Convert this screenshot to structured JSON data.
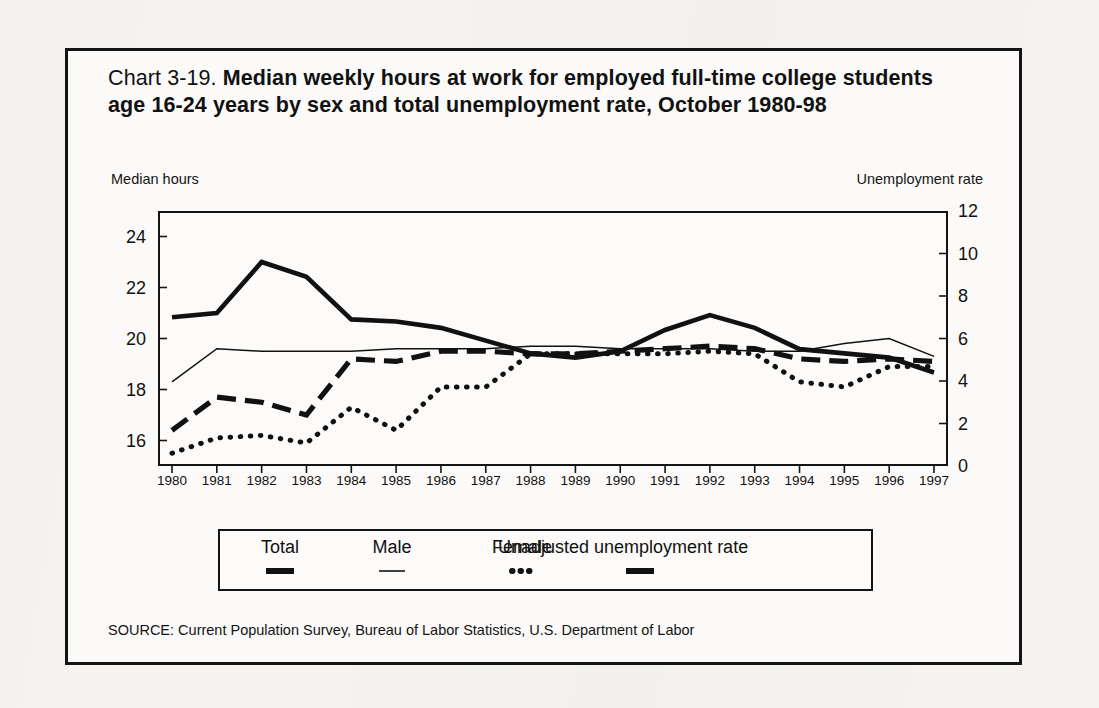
{
  "figure": {
    "title_prefix": "Chart 3-19. ",
    "title_main": "Median weekly hours at work for employed full-time college students age 16-24 years by sex and total unemployment rate, October 1980-98",
    "source": "SOURCE: Current Population Survey, Bureau of Labor Statistics, U.S. Department of Labor",
    "frame_color": "#141414"
  },
  "legend": {
    "entries": [
      {
        "label": "Total",
        "style": "thick-dash",
        "name": "legend-total"
      },
      {
        "label": "Male",
        "style": "thin-solid",
        "name": "legend-male"
      },
      {
        "label": "Female",
        "style": "dotted",
        "name": "legend-female"
      },
      {
        "label": "Unadjusted unemployment rate",
        "style": "thick-solid",
        "name": "legend-unemployment"
      }
    ]
  },
  "chart_data": {
    "type": "line",
    "title": "Chart 3-19. Median weekly hours at work for employed full-time college students age 16-24 years by sex and total unemployment rate, October 1980-98",
    "xlabel": "",
    "ylabel": "Median hours",
    "y2label": "Unemployment rate",
    "left_axis_caption": "Median hours",
    "right_axis_caption": "Unemployment rate",
    "grid": false,
    "legend_position": "below",
    "x": [
      1980,
      1981,
      1982,
      1983,
      1984,
      1985,
      1986,
      1987,
      1988,
      1989,
      1990,
      1991,
      1992,
      1993,
      1994,
      1995,
      1996,
      1997
    ],
    "categories": [
      "1980",
      "1981",
      "1982",
      "1983",
      "1984",
      "1985",
      "1986",
      "1987",
      "1988",
      "1989",
      "1990",
      "1991",
      "1992",
      "1993",
      "1994",
      "1995",
      "1996",
      "1997"
    ],
    "ylim": [
      15,
      25
    ],
    "yticks": [
      16,
      18,
      20,
      22,
      24
    ],
    "ytick_labels": [
      "16",
      "18",
      "20",
      "22",
      "24"
    ],
    "y2lim": [
      0,
      12
    ],
    "y2ticks": [
      0,
      2,
      4,
      6,
      8,
      10,
      12
    ],
    "y2tick_labels": [
      "0",
      "2",
      "4",
      "6",
      "8",
      "10",
      "12"
    ],
    "series": [
      {
        "name": "Total",
        "axis": "left",
        "style": "thick-dash",
        "values": [
          16.4,
          17.7,
          17.5,
          17.0,
          19.2,
          19.1,
          19.5,
          19.5,
          19.4,
          19.4,
          19.5,
          19.6,
          19.7,
          19.6,
          19.2,
          19.1,
          19.2,
          19.1
        ]
      },
      {
        "name": "Male",
        "axis": "left",
        "style": "thin-solid",
        "values": [
          18.3,
          19.6,
          19.5,
          19.5,
          19.5,
          19.6,
          19.6,
          19.6,
          19.7,
          19.7,
          19.6,
          19.6,
          19.6,
          19.5,
          19.5,
          19.8,
          20.0,
          19.3
        ]
      },
      {
        "name": "Female",
        "axis": "left",
        "style": "dotted",
        "values": [
          15.5,
          16.1,
          16.2,
          15.9,
          17.3,
          16.4,
          18.1,
          18.1,
          19.4,
          19.4,
          19.4,
          19.4,
          19.5,
          19.4,
          18.3,
          18.1,
          18.9,
          18.9
        ]
      },
      {
        "name": "Unadjusted unemployment rate",
        "axis": "right",
        "style": "thick-solid",
        "values": [
          7.0,
          7.2,
          9.6,
          8.9,
          6.9,
          6.8,
          6.5,
          5.9,
          5.3,
          5.1,
          5.4,
          6.4,
          7.1,
          6.5,
          5.5,
          5.3,
          5.1,
          4.4
        ]
      }
    ]
  }
}
